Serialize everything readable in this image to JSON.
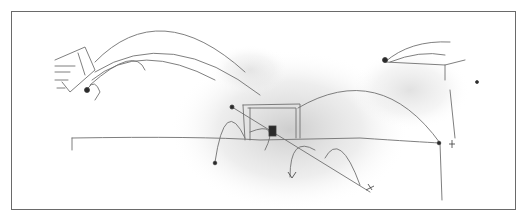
{
  "figure": {
    "colors": {
      "paper": "#ffffff",
      "frame": "#6a6a6a",
      "pencil": "#6e6e6e",
      "smudge": "#d8d8d8",
      "ink": "#2a2a2a"
    }
  }
}
